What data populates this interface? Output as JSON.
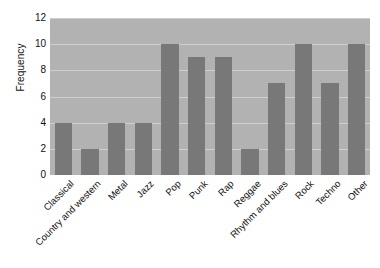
{
  "chart_data": {
    "type": "bar",
    "title": "",
    "xlabel": "",
    "ylabel": "Frequency",
    "ylim": [
      0,
      12
    ],
    "ytick_step": 2,
    "grid": true,
    "legend": "none",
    "orientation": "vertical",
    "xtick_rotation": -45,
    "categories": [
      "Classical",
      "Country and western",
      "Metal",
      "Jazz",
      "Pop",
      "Punk",
      "Rap",
      "Reggae",
      "Rhythm and blues",
      "Rock",
      "Techno",
      "Other"
    ],
    "values": [
      4,
      2,
      4,
      4,
      10,
      9,
      9,
      2,
      7,
      10,
      7,
      10
    ],
    "ytick_labels": [
      "0",
      "2",
      "4",
      "6",
      "8",
      "10",
      "12"
    ],
    "ytick_values": [
      0,
      2,
      4,
      6,
      8,
      10,
      12
    ]
  },
  "style": {
    "page_background": "#ffffff",
    "plot_background": "#b2b2b2",
    "bar_color": "#787878",
    "gridline_color": "#cfcfcf",
    "text_color": "#111111"
  }
}
